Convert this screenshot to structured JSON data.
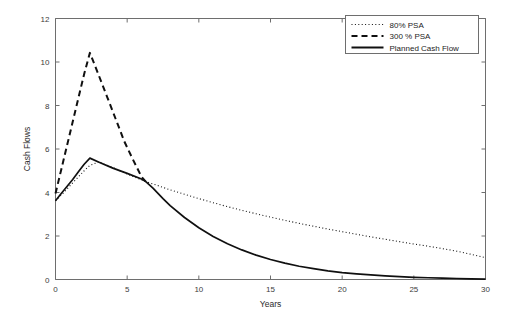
{
  "chart_data": {
    "type": "line",
    "title": "",
    "xlabel": "Years",
    "ylabel": "Cash Flows",
    "xlim": [
      0,
      30
    ],
    "ylim": [
      0,
      12
    ],
    "xticks": [
      "0",
      "5",
      "10",
      "15",
      "20",
      "25",
      "30"
    ],
    "xtick_values": [
      0,
      5,
      10,
      15,
      20,
      25,
      30
    ],
    "yticks": [
      "0",
      "2",
      "4",
      "6",
      "8",
      "10",
      "12"
    ],
    "ytick_values": [
      0,
      2,
      4,
      6,
      8,
      10,
      12
    ],
    "grid": false,
    "legend_position": "top-right",
    "series": [
      {
        "name": "80% PSA",
        "style": "dotted",
        "x": [
          0,
          0.5,
          1,
          1.5,
          2,
          2.4,
          3,
          4,
          5,
          6,
          6.3,
          7,
          8,
          9,
          10,
          11,
          12,
          13,
          14,
          15,
          16,
          17,
          18,
          19,
          20,
          21,
          22,
          23,
          24,
          25,
          26,
          27,
          28,
          29,
          30
        ],
        "values": [
          3.62,
          3.95,
          4.3,
          4.65,
          5.0,
          5.25,
          5.4,
          5.15,
          4.85,
          4.58,
          4.5,
          4.35,
          4.12,
          3.92,
          3.72,
          3.53,
          3.35,
          3.18,
          3.02,
          2.87,
          2.72,
          2.58,
          2.45,
          2.32,
          2.2,
          2.08,
          1.96,
          1.85,
          1.74,
          1.63,
          1.53,
          1.42,
          1.3,
          1.16,
          1.0
        ]
      },
      {
        "name": "300 % PSA",
        "style": "dashed",
        "x": [
          0,
          0.4,
          0.8,
          1.2,
          1.6,
          2.0,
          2.4,
          3.0,
          3.6,
          4.2,
          4.8,
          5.4,
          6.0,
          6.3
        ],
        "values": [
          3.95,
          5.05,
          6.15,
          7.25,
          8.35,
          9.45,
          10.42,
          9.42,
          8.4,
          7.38,
          6.35,
          5.52,
          4.72,
          4.5
        ]
      },
      {
        "name": "Planned Cash Flow",
        "style": "solid",
        "x": [
          0,
          0.4,
          0.8,
          1.2,
          1.6,
          2.0,
          2.4,
          3,
          4,
          5,
          6,
          6.3,
          6.8,
          7.5,
          8,
          9,
          10,
          11,
          12,
          13,
          14,
          15,
          16,
          17,
          18,
          19,
          20,
          21,
          22,
          23,
          24,
          25,
          26,
          27,
          28,
          29,
          30
        ],
        "values": [
          3.62,
          3.95,
          4.28,
          4.6,
          4.95,
          5.3,
          5.58,
          5.4,
          5.12,
          4.88,
          4.62,
          4.5,
          4.2,
          3.72,
          3.4,
          2.85,
          2.38,
          1.98,
          1.64,
          1.36,
          1.12,
          0.92,
          0.75,
          0.61,
          0.5,
          0.4,
          0.32,
          0.26,
          0.21,
          0.17,
          0.13,
          0.1,
          0.08,
          0.06,
          0.045,
          0.03,
          0.02
        ]
      }
    ]
  },
  "legend": {
    "items": [
      {
        "label": "80% PSA",
        "style": "dotted"
      },
      {
        "label": "300 % PSA",
        "style": "dashed"
      },
      {
        "label": "Planned Cash Flow",
        "style": "solid"
      }
    ]
  },
  "axes": {
    "x_title": "Years",
    "y_title": "Cash Flows"
  }
}
